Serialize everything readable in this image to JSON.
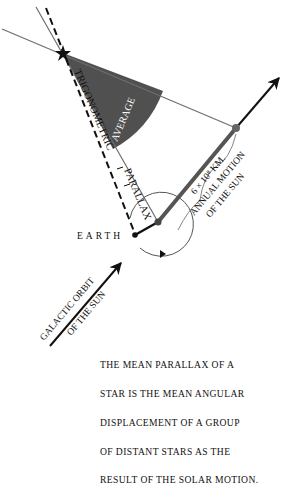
{
  "diagram": {
    "labels": {
      "trigonometric": "TRIGONOMETRIC",
      "parallax": "PARALLAX",
      "average": "AVERAGE",
      "p_symbol": "p",
      "earth": "EARTH",
      "distance": "6 × 10⁸ KM.",
      "annual_motion": "ANNUAL MOTION",
      "of_the_sun": "OF THE SUN",
      "galactic_orbit": "GALACTIC ORBIT",
      "galactic_of_the_sun": "OF THE SUN"
    },
    "caption_lines": [
      "THE MEAN PARALLAX OF A",
      "STAR IS THE MEAN ANGULAR",
      "DISPLACEMENT OF A GROUP",
      "OF DISTANT STARS AS THE",
      "RESULT OF THE SOLAR MOTION."
    ],
    "colors": {
      "shaded_wedge": "#505050",
      "thin_line": "#6e6e6e",
      "solar_motion_bar": "#555555",
      "ink": "#111111"
    }
  }
}
